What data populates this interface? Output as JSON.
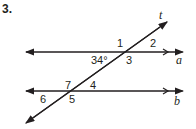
{
  "problem_number": "3.",
  "lines": {
    "transversal": "t",
    "line_a": "a",
    "line_b": "b"
  },
  "angles": {
    "given": "34°",
    "labels": [
      "1",
      "2",
      "3",
      "4",
      "5",
      "6",
      "7"
    ]
  }
}
